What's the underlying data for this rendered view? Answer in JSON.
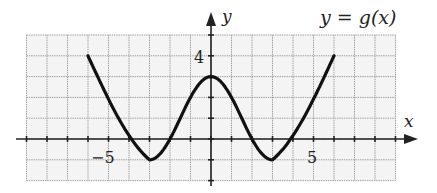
{
  "chart_data": {
    "type": "line",
    "title": "y = g(x)",
    "xlabel": "x",
    "ylabel": "y",
    "xlim": [
      -9,
      9
    ],
    "ylim": [
      -2,
      5
    ],
    "grid": true,
    "tick_labels": {
      "x": [
        "-5",
        "5"
      ],
      "y": [
        "4"
      ]
    },
    "series": [
      {
        "name": "g(x)",
        "x": [
          -6,
          -4,
          -3,
          -2,
          0,
          2,
          3,
          4,
          6
        ],
        "y": [
          4,
          0,
          -1,
          0,
          3,
          0,
          -1,
          0,
          4
        ]
      }
    ],
    "key_points": {
      "start": [
        -6,
        4
      ],
      "local_min_1": [
        -3,
        -1
      ],
      "local_max": [
        0,
        3
      ],
      "local_min_2": [
        3,
        -1
      ],
      "end": [
        6,
        4
      ]
    }
  },
  "labels": {
    "title": "y = g(x)",
    "x_axis": "x",
    "y_axis": "y",
    "x_tick_neg5": "−5",
    "x_tick_5": "5",
    "y_tick_4": "4"
  },
  "colors": {
    "grid": "#9a9a9a",
    "axis": "#222222",
    "curve": "#111111",
    "grid_bg": "#f4f4f4"
  }
}
